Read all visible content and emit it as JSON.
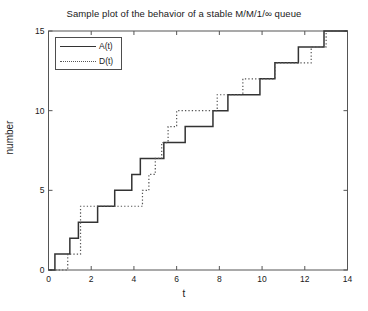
{
  "chart_data": {
    "type": "line",
    "title": "Sample plot of the behavior of a stable M/M/1/∞ queue",
    "xlabel": "t",
    "ylabel": "number",
    "xlim": [
      0,
      14
    ],
    "ylim": [
      0,
      15
    ],
    "xticks": [
      0,
      2,
      4,
      6,
      8,
      10,
      12,
      14
    ],
    "xtick_labels": [
      "0",
      "2",
      "4",
      "6",
      "8",
      "10",
      "12",
      "14"
    ],
    "yticks": [
      0,
      5,
      10,
      15
    ],
    "ytick_labels": [
      "0",
      "5",
      "10",
      "15"
    ],
    "grid": false,
    "legend_position": "upper left",
    "step_interpolation": "post",
    "series": [
      {
        "name": "A(t)",
        "label": "A(t)",
        "linestyle": "solid",
        "color": "#333333",
        "jump_times": [
          0.3,
          1.0,
          1.4,
          2.3,
          3.1,
          3.9,
          4.3,
          5.4,
          6.4,
          7.7,
          8.4,
          9.9,
          10.6,
          11.7,
          12.9
        ],
        "x": [
          0.0,
          0.3,
          1.0,
          1.4,
          2.3,
          3.1,
          3.9,
          4.3,
          5.4,
          6.4,
          7.7,
          8.4,
          9.9,
          10.6,
          11.7,
          12.9,
          14.0
        ],
        "values": [
          0,
          1,
          2,
          3,
          4,
          5,
          6,
          7,
          8,
          9,
          10,
          11,
          12,
          13,
          14,
          15,
          15
        ]
      },
      {
        "name": "D(t)",
        "label": "D(t)",
        "linestyle": "dotted",
        "color": "#555555",
        "jump_times": [
          0.9,
          1.5,
          4.4,
          4.7,
          5.0,
          5.3,
          5.6,
          6.0,
          7.9,
          9.1,
          10.2,
          10.6,
          11.6,
          12.3,
          13.0
        ],
        "x": [
          0.0,
          0.9,
          1.5,
          4.4,
          4.7,
          5.0,
          5.3,
          5.6,
          6.0,
          7.9,
          9.1,
          10.2,
          10.6,
          11.6,
          12.3,
          13.0,
          14.0
        ],
        "values": [
          0,
          1,
          4,
          5,
          6,
          7,
          8,
          9,
          10,
          11,
          12,
          12,
          13,
          13,
          14,
          15,
          15
        ]
      }
    ]
  },
  "legend": {
    "entries": [
      {
        "label": "A(t)",
        "style": "solid"
      },
      {
        "label": "D(t)",
        "style": "dotted"
      }
    ]
  }
}
